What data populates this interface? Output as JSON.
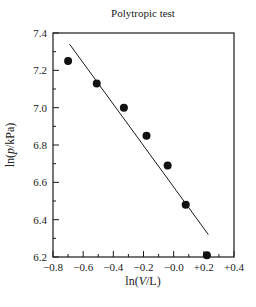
{
  "chart_data": {
    "type": "scatter",
    "title": "Polytropic test",
    "xlabel": "ln(V/L)",
    "ylabel": "ln(p/kPa)",
    "xlim": [
      -0.8,
      0.4
    ],
    "ylim": [
      6.2,
      7.4
    ],
    "x_ticks": [
      "−0.8",
      "−0.6",
      "−0.4",
      "−0.2",
      "−0.0",
      "+0.2",
      "+0.4"
    ],
    "x_tick_values": [
      -0.8,
      -0.6,
      -0.4,
      -0.2,
      0.0,
      0.2,
      0.4
    ],
    "y_ticks": [
      "6.2",
      "6.4",
      "6.6",
      "6.8",
      "7.0",
      "7.2",
      "7.4"
    ],
    "y_tick_values": [
      6.2,
      6.4,
      6.6,
      6.8,
      7.0,
      7.2,
      7.4
    ],
    "grid": false,
    "legend": null,
    "series": [
      {
        "name": "measured",
        "kind": "points",
        "x": [
          -0.7,
          -0.51,
          -0.33,
          -0.18,
          -0.04,
          0.08,
          0.22
        ],
        "y": [
          7.25,
          7.13,
          7.0,
          6.85,
          6.69,
          6.48,
          6.21
        ]
      },
      {
        "name": "linear fit",
        "kind": "line",
        "x": [
          -0.69,
          0.23
        ],
        "y": [
          7.34,
          6.32
        ]
      }
    ]
  },
  "colors": {
    "ink": "#1a1a1a",
    "background": "#ffffff"
  }
}
